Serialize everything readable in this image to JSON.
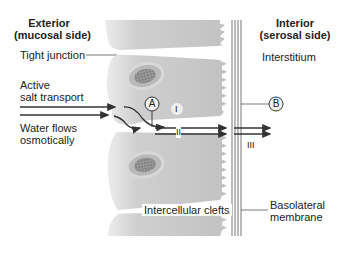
{
  "figure": {
    "exterior_header": {
      "line1": "Exterior",
      "line2": "(mucosal side)"
    },
    "interior_header": {
      "line1": "Interior",
      "line2": "(serosal side)"
    },
    "labels": {
      "tight_junction": "Tight junction",
      "active_salt_transport_1": "Active",
      "active_salt_transport_2": "salt transport",
      "water_flows_1": "Water flows",
      "water_flows_2": "osmotically",
      "interstitium": "Interstitium",
      "intercellular_clefts": "Intercellular clefts",
      "basolateral_1": "Basolateral",
      "basolateral_2": "membrane"
    },
    "markers": {
      "a": "A",
      "b": "B"
    },
    "regions": {
      "i": "I",
      "ii": "II",
      "iii": "III"
    },
    "colors": {
      "cell_fill": "#c9c9c9",
      "cell_light": "#e6e6e6",
      "nucleus_ring": "#a8a8a8",
      "arrow": "#333333"
    }
  }
}
